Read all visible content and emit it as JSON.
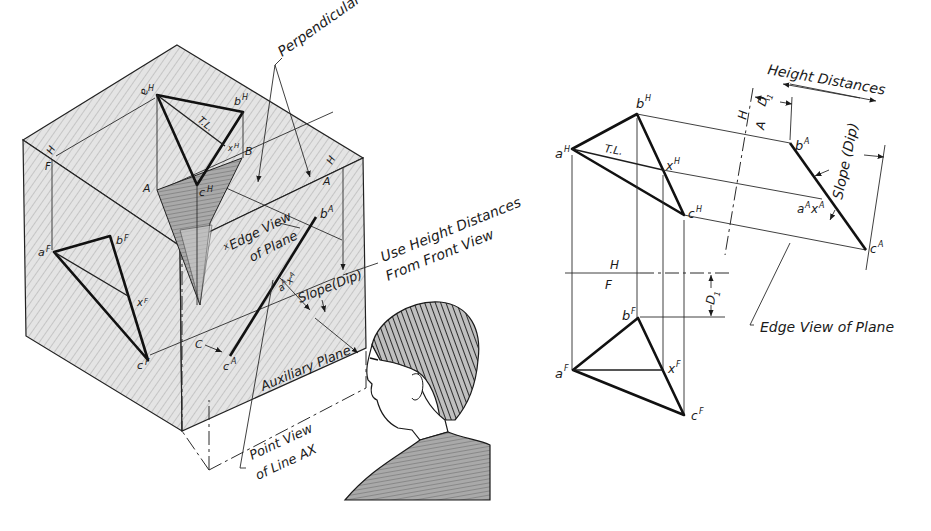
{
  "figure": {
    "pictorial": {
      "callouts": {
        "perpendicular": "Perpendicular",
        "use_height_1": "Use Height Distances",
        "use_height_2": "From Front View",
        "edge_view_1": "Edge View",
        "edge_view_2": "of Plane",
        "slope": "Slope(Dip)",
        "auxiliary_plane": "Auxiliary Plane",
        "point_view_1": "Point View",
        "point_view_2": "of Line AX",
        "true_length": "T.L."
      },
      "points": {
        "aH": "a",
        "aH_sup": "H",
        "bH": "b",
        "bH_sup": "H",
        "cH": "c",
        "cH_sup": "H",
        "xH": "x",
        "xH_sup": "H",
        "aF": "a",
        "aF_sup": "F",
        "bF": "b",
        "bF_sup": "F",
        "cF": "c",
        "cF_sup": "F",
        "xF": "x",
        "xF_sup": "F",
        "bA": "b",
        "bA_sup": "A",
        "cA": "c",
        "cA_sup": "A",
        "aAxA": "a",
        "aAxA_sup1": "A",
        "aAxA_x": "x",
        "aAxA_sup2": "A",
        "x_edge": "x"
      },
      "fold_labels": {
        "H_left": "H",
        "F_left": "F",
        "A_top": "A",
        "B_top": "B",
        "H_right": "H",
        "A_right": "A",
        "C_bottom": "C"
      }
    },
    "orthographic": {
      "callouts": {
        "height_distances": "Height Distances",
        "slope": "Slope (Dip)",
        "edge_view": "Edge View of Plane",
        "true_length": "T.L.",
        "d1": "D",
        "d1_sub": "1"
      },
      "fold_lines": {
        "ha_H": "H",
        "ha_A": "A",
        "hf_H": "H",
        "hf_F": "F"
      },
      "points": {
        "aH": "a",
        "aH_sup": "H",
        "bH": "b",
        "bH_sup": "H",
        "cH": "c",
        "cH_sup": "H",
        "xH": "x",
        "xH_sup": "H",
        "bA": "b",
        "bA_sup": "A",
        "cA": "c",
        "cA_sup": "A",
        "aAxA_a": "a",
        "aAxA_sup1": "A",
        "aAxA_x": "x",
        "aAxA_sup2": "A",
        "aF": "a",
        "aF_sup": "F",
        "bF": "b",
        "bF_sup": "F",
        "cF": "c",
        "cF_sup": "F",
        "xF": "x",
        "xF_sup": "F"
      }
    }
  }
}
